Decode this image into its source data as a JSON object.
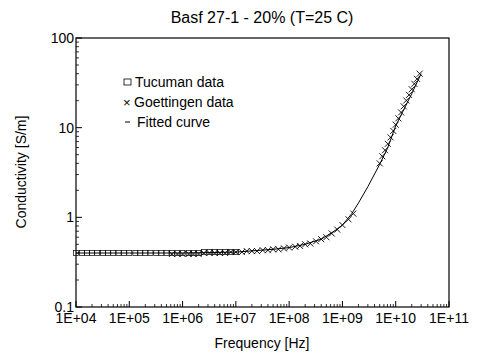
{
  "chart_data": {
    "type": "scatter",
    "title": "Basf 27-1  -  20%  (T=25 C)",
    "xlabel": "Frequency [Hz]",
    "ylabel": "Conductivity [S/m]",
    "xscale": "log",
    "yscale": "log",
    "xlim": [
      10000,
      100000000000
    ],
    "ylim": [
      0.1,
      100
    ],
    "grid": false,
    "legend_position": "upper-left",
    "x_tick_labels": [
      "1E+04",
      "1E+05",
      "1E+06",
      "1E+07",
      "1E+08",
      "1E+09",
      "1E+10",
      "1E+11"
    ],
    "y_tick_labels": [
      "0.1",
      "1",
      "10",
      "100"
    ],
    "legend": [
      {
        "marker": "square",
        "label": "Tucuman data"
      },
      {
        "marker": "x",
        "label": "Goettingen data"
      },
      {
        "marker": "line",
        "label": "Fitted curve"
      }
    ],
    "series": [
      {
        "name": "Tucuman data",
        "marker": "square",
        "x": [
          10000,
          13000,
          16000,
          20000,
          25000,
          32000,
          40000,
          50000,
          63000,
          80000,
          100000,
          130000,
          160000,
          200000,
          250000,
          320000,
          400000,
          500000,
          630000,
          800000,
          1000000,
          1300000,
          1600000,
          2000000,
          2500000,
          3200000,
          4000000,
          5000000,
          6300000,
          8000000,
          10000000
        ],
        "y": [
          0.4,
          0.4,
          0.4,
          0.4,
          0.4,
          0.4,
          0.4,
          0.4,
          0.4,
          0.4,
          0.4,
          0.4,
          0.4,
          0.4,
          0.4,
          0.4,
          0.4,
          0.4,
          0.4,
          0.4,
          0.4,
          0.4,
          0.4,
          0.4,
          0.41,
          0.41,
          0.41,
          0.41,
          0.41,
          0.41,
          0.41
        ]
      },
      {
        "name": "Goettingen data",
        "marker": "x",
        "x": [
          630000,
          800000,
          1000000,
          1300000,
          1600000,
          2000000,
          2500000,
          3200000,
          4000000,
          5000000,
          6300000,
          8000000,
          10000000,
          13000000,
          16000000,
          20000000,
          25000000,
          32000000,
          40000000,
          50000000,
          63000000,
          80000000,
          100000000,
          130000000,
          160000000,
          200000000,
          250000000,
          320000000,
          400000000,
          500000000,
          630000000,
          800000000,
          1000000000,
          1300000000,
          1600000000,
          5000000000,
          5600000000,
          6300000000,
          7100000000,
          8000000000,
          9000000000,
          10000000000,
          11200000000,
          12600000000,
          14100000000,
          15800000000,
          17800000000,
          20000000000,
          22400000000,
          25100000000,
          28200000000
        ],
        "y": [
          0.39,
          0.39,
          0.39,
          0.39,
          0.39,
          0.39,
          0.4,
          0.4,
          0.4,
          0.4,
          0.4,
          0.41,
          0.41,
          0.41,
          0.42,
          0.42,
          0.42,
          0.43,
          0.43,
          0.44,
          0.44,
          0.45,
          0.46,
          0.47,
          0.48,
          0.5,
          0.51,
          0.54,
          0.57,
          0.6,
          0.66,
          0.73,
          0.82,
          0.95,
          1.1,
          4.0,
          4.8,
          5.6,
          6.6,
          7.8,
          9.2,
          10.8,
          12.7,
          14.8,
          17.3,
          20.1,
          23.2,
          26.8,
          30.8,
          35.0,
          40.0
        ]
      },
      {
        "name": "Fitted curve",
        "marker": "line",
        "x": [
          10000,
          100000,
          1000000,
          10000000,
          50000000,
          100000000,
          200000000,
          400000000,
          700000000,
          1000000000,
          1500000000,
          2000000000,
          3000000000,
          5000000000,
          7000000000,
          10000000000,
          15000000000,
          20000000000,
          30000000000
        ],
        "y": [
          0.4,
          0.4,
          0.4,
          0.41,
          0.44,
          0.46,
          0.5,
          0.57,
          0.7,
          0.82,
          1.1,
          1.45,
          2.2,
          3.9,
          5.9,
          10.5,
          17.0,
          24.0,
          40.0
        ]
      }
    ]
  }
}
